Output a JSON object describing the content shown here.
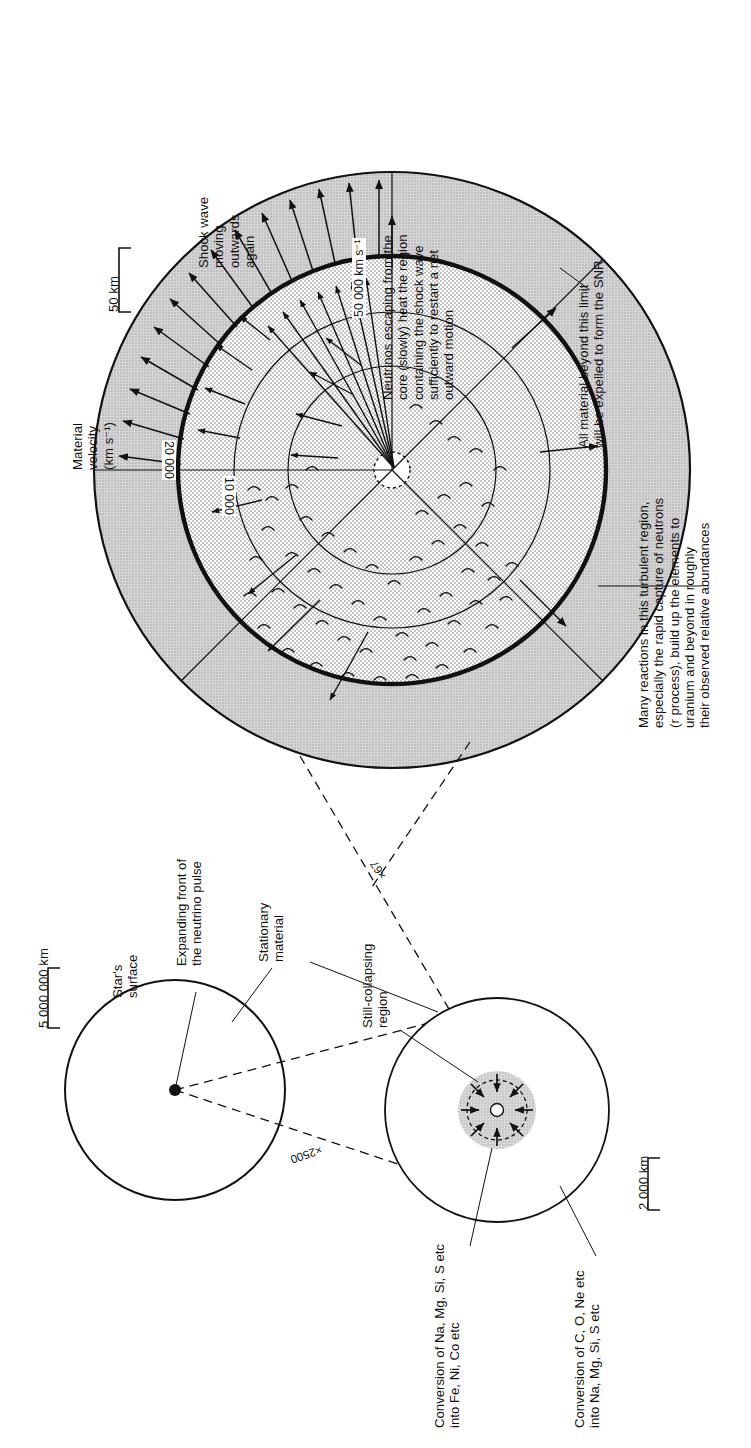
{
  "figure": {
    "kind": "supernova-core-collapse-diagram",
    "orientation": "text rotated 90 degrees counter-clockwise"
  },
  "top_panel": {
    "name": "shock-revival-panel",
    "scale_bar": "50 km",
    "velocity_axis_label": "Material\nvelocity\n(km s⁻¹)",
    "velocity_ticks": [
      "50 000 km s⁻¹",
      "20 000",
      "10 000"
    ],
    "annotations": {
      "shock_wave": "Shock wave\nmoving\noutwards\nagain",
      "neutrinos": "Neutrinos escaping from the\ncore (slowly) heat the region\ncontaining the shock wave\nsufficiently to restart a net\noutward motion",
      "expelled": "All material beyond this limit\nwill be expelled to form the SNR",
      "r_process": "Many reactions in this turbulent region,\nespecially the rapid capture of neutrons\n(r process), build up the elements to\nuranium and beyond in roughly\ntheir observed relative abundances"
    }
  },
  "star_panel": {
    "name": "whole-star-panel",
    "scale_bar": "5 000 000 km",
    "annotations": {
      "star_surface": "Star's\nsurface",
      "neutrino_pulse": "Expanding front of\nthe neutrino pulse"
    }
  },
  "core_panel": {
    "name": "collapsing-core-panel",
    "scale_bar": "2 000 km",
    "annotations": {
      "stationary_material": "Stationary\nmaterial",
      "still_collapsing": "Still-collapsing\nregion",
      "conversion_a": "Conversion of Na, Mg, Si, S etc\ninto Fe, Ni, Co etc",
      "conversion_b": "Conversion of C, O, Ne etc\ninto Na, Mg, Si, S etc"
    }
  },
  "magnifications": {
    "star_to_core": "×2500",
    "core_to_shock": "×67"
  },
  "colors": {
    "ink": "#111111",
    "shell_fill": "#c9c9c9",
    "turbulent_fill": "#d8d8d8",
    "paper": "#ffffff"
  }
}
